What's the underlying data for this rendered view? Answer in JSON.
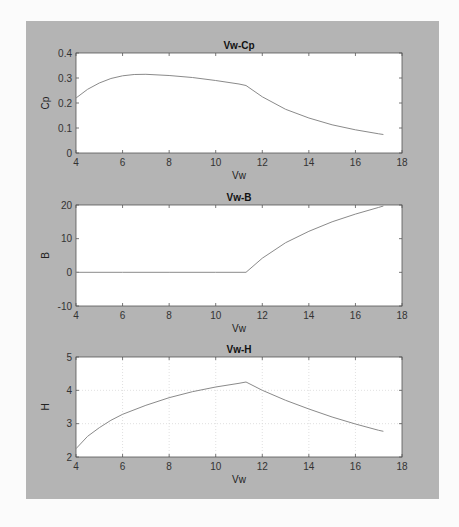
{
  "chart_data": [
    {
      "type": "line",
      "title": "Vw-Cp",
      "xlabel": "Vw",
      "ylabel": "Cp",
      "xlim": [
        4,
        18
      ],
      "ylim": [
        0,
        0.4
      ],
      "xticks": [
        4,
        6,
        8,
        10,
        12,
        14,
        16,
        18
      ],
      "yticks": [
        0,
        0.1,
        0.2,
        0.3,
        0.4
      ],
      "grid": false,
      "x": [
        4,
        4.5,
        5,
        5.5,
        6,
        6.5,
        7,
        8,
        9,
        10,
        11,
        11.3,
        12,
        13,
        14,
        15,
        16,
        17,
        17.2
      ],
      "values": [
        0.22,
        0.255,
        0.28,
        0.298,
        0.309,
        0.314,
        0.315,
        0.31,
        0.302,
        0.29,
        0.276,
        0.27,
        0.225,
        0.175,
        0.14,
        0.113,
        0.093,
        0.077,
        0.074
      ]
    },
    {
      "type": "line",
      "title": "Vw-B",
      "xlabel": "Vw",
      "ylabel": "B",
      "xlim": [
        4,
        18
      ],
      "ylim": [
        -10,
        20
      ],
      "xticks": [
        4,
        6,
        8,
        10,
        12,
        14,
        16,
        18
      ],
      "yticks": [
        -10,
        0,
        10,
        20
      ],
      "grid": false,
      "x": [
        4,
        6,
        8,
        10,
        11.3,
        12,
        13,
        14,
        15,
        16,
        17,
        17.2
      ],
      "values": [
        0,
        0,
        0,
        0,
        0,
        4.2,
        8.8,
        12.2,
        15.0,
        17.3,
        19.3,
        19.7
      ]
    },
    {
      "type": "line",
      "title": "Vw-H",
      "xlabel": "Vw",
      "ylabel": "H",
      "xlim": [
        4,
        18
      ],
      "ylim": [
        2,
        5
      ],
      "xticks": [
        4,
        6,
        8,
        10,
        12,
        14,
        16,
        18
      ],
      "yticks": [
        2,
        3,
        4,
        5
      ],
      "grid": true,
      "x": [
        4,
        4.5,
        5,
        5.5,
        6,
        7,
        8,
        9,
        10,
        11,
        11.3,
        12,
        13,
        14,
        15,
        16,
        17,
        17.2
      ],
      "values": [
        2.25,
        2.62,
        2.88,
        3.1,
        3.28,
        3.55,
        3.78,
        3.96,
        4.1,
        4.21,
        4.25,
        4.0,
        3.7,
        3.44,
        3.2,
        2.99,
        2.8,
        2.77
      ]
    }
  ]
}
